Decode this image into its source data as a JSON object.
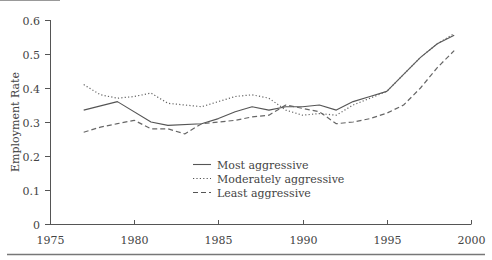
{
  "chart_data": {
    "type": "line",
    "title": "",
    "xlabel": "",
    "ylabel": "Employment Rate",
    "xlim": [
      1975,
      2000
    ],
    "ylim": [
      0,
      0.6
    ],
    "x_ticks": [
      1975,
      1980,
      1985,
      1990,
      1995,
      2000
    ],
    "y_ticks": [
      0,
      0.1,
      0.2,
      0.3,
      0.4,
      0.5,
      0.6
    ],
    "y_tick_labels": [
      "0",
      "0.1",
      "0.2",
      "0.3",
      "0.4",
      "0.5",
      "0.6"
    ],
    "grid": false,
    "legend_position": "center-lower",
    "series": [
      {
        "name": "Most aggressive",
        "style": "solid",
        "color": "#555555",
        "x": [
          1977,
          1979,
          1981,
          1982,
          1984,
          1985,
          1986,
          1987,
          1988,
          1989,
          1990,
          1991,
          1992,
          1993,
          1994,
          1995,
          1996,
          1997,
          1998,
          1999
        ],
        "values": [
          0.335,
          0.36,
          0.3,
          0.29,
          0.295,
          0.31,
          0.33,
          0.345,
          0.335,
          0.345,
          0.345,
          0.35,
          0.335,
          0.36,
          0.375,
          0.39,
          0.44,
          0.49,
          0.53,
          0.555
        ]
      },
      {
        "name": "Moderately aggressive",
        "style": "dotted",
        "color": "#666666",
        "x": [
          1977,
          1978,
          1979,
          1980,
          1981,
          1982,
          1983,
          1984,
          1985,
          1986,
          1987,
          1988,
          1989,
          1990,
          1991,
          1992,
          1993,
          1994,
          1995,
          1996,
          1997,
          1998,
          1999
        ],
        "values": [
          0.41,
          0.38,
          0.37,
          0.375,
          0.385,
          0.355,
          0.35,
          0.345,
          0.36,
          0.375,
          0.38,
          0.37,
          0.335,
          0.32,
          0.325,
          0.32,
          0.35,
          0.37,
          0.39,
          0.44,
          0.49,
          0.53,
          0.56
        ]
      },
      {
        "name": "Least aggressive",
        "style": "dashed",
        "color": "#666666",
        "x": [
          1977,
          1978,
          1979,
          1980,
          1981,
          1982,
          1983,
          1984,
          1985,
          1986,
          1987,
          1988,
          1989,
          1990,
          1991,
          1992,
          1993,
          1994,
          1995,
          1996,
          1997,
          1998,
          1999
        ],
        "values": [
          0.27,
          0.285,
          0.295,
          0.305,
          0.28,
          0.28,
          0.265,
          0.295,
          0.3,
          0.305,
          0.315,
          0.32,
          0.35,
          0.34,
          0.33,
          0.295,
          0.3,
          0.31,
          0.326,
          0.35,
          0.4,
          0.46,
          0.51
        ]
      }
    ]
  },
  "legend": {
    "items": [
      {
        "label": "Most aggressive",
        "style": "solid"
      },
      {
        "label": "Moderately aggressive",
        "style": "dotted"
      },
      {
        "label": "Least aggressive",
        "style": "dashed"
      }
    ]
  },
  "colors": {
    "axis": "#555555",
    "rule": "#777777",
    "text": "#444444"
  }
}
